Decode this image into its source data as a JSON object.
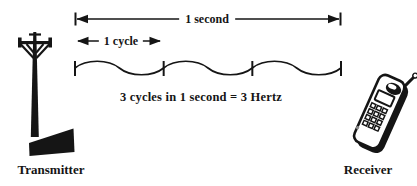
{
  "diagram": {
    "caption": "3 cycles in 1 second = 3 Hertz",
    "timing": {
      "total_label": "1 second",
      "cycle_label": "1 cycle"
    },
    "nodes": {
      "transmitter_label": "Transmitter",
      "receiver_label": "Receiver"
    },
    "wave": {
      "cycles": 3,
      "duration_seconds": 1,
      "frequency_hertz": 3
    },
    "icons": {
      "left": "transmitter-tower-icon",
      "right": "receiver-phone-icon"
    },
    "colors": {
      "ink": "#151515",
      "paper": "#ffffff"
    }
  }
}
